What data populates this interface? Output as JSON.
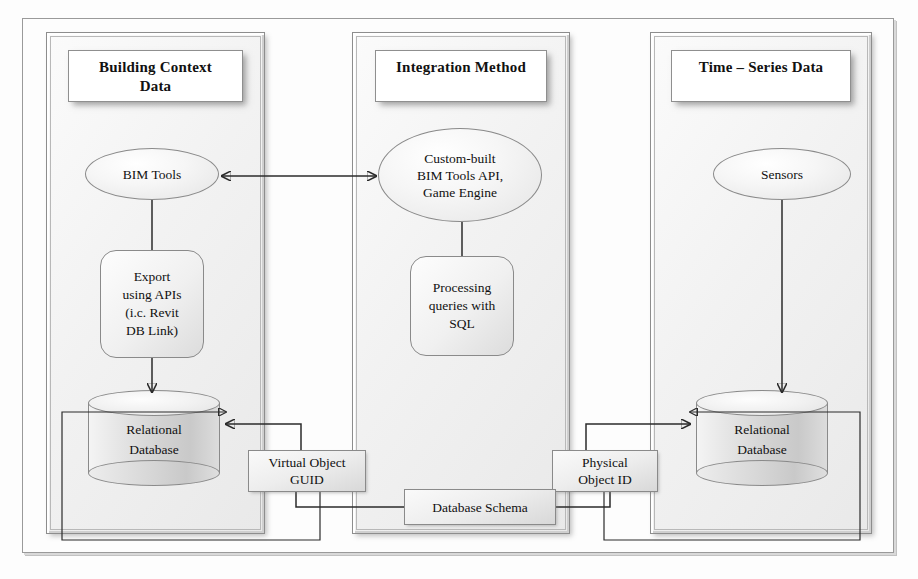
{
  "diagram": {
    "panels": [
      {
        "id": "building-context-data",
        "title": "Building Context\nData"
      },
      {
        "id": "integration-method",
        "title": "Integration Method"
      },
      {
        "id": "time-series-data",
        "title": "Time – Series Data"
      }
    ],
    "nodes": {
      "bim_tools": "BIM Tools",
      "custom_built": "Custom-built\nBIM Tools API,\nGame Engine",
      "sensors": "Sensors",
      "export_apis": "Export\nusing APIs\n(i.c. Revit\nDB Link)",
      "processing_sql": "Processing\nqueries with\nSQL",
      "relational_db_left": "Relational\nDatabase",
      "relational_db_right": "Relational\nDatabase",
      "virtual_object_guid": "Virtual Object\nGUID",
      "physical_object_id": "Physical\nObject ID",
      "database_schema": "Database Schema"
    },
    "connectors": [
      {
        "from": "bim_tools",
        "to": "custom_built",
        "type": "bidirectional-arrow"
      },
      {
        "from": "bim_tools",
        "to": "export_apis",
        "type": "line"
      },
      {
        "from": "export_apis",
        "to": "relational_db_left",
        "type": "arrow"
      },
      {
        "from": "custom_built",
        "to": "processing_sql",
        "type": "line"
      },
      {
        "from": "sensors",
        "to": "relational_db_right",
        "type": "arrow"
      },
      {
        "from": "virtual_object_guid",
        "to": "relational_db_left",
        "type": "arrow"
      },
      {
        "from": "physical_object_id",
        "to": "relational_db_right",
        "type": "arrow"
      },
      {
        "from": "database_schema",
        "to": "relational_db_left",
        "type": "arrow"
      },
      {
        "from": "database_schema",
        "to": "relational_db_right",
        "type": "arrow"
      },
      {
        "from": "virtual_object_guid",
        "to": "database_schema",
        "type": "line"
      },
      {
        "from": "physical_object_id",
        "to": "database_schema",
        "type": "line"
      }
    ],
    "colors": {
      "ink": "#111111",
      "stroke": "#2b2b2b",
      "panel_border": "#8d8d8d",
      "plate_fill": "#ffffff",
      "cylinder_fill": "#d2d2d2"
    }
  }
}
